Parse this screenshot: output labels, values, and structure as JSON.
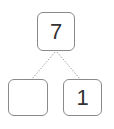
{
  "number_bond": {
    "whole": "7",
    "parts": [
      "",
      "1"
    ]
  },
  "colors": {
    "border": "#8a8a8a",
    "text": "#333333",
    "connector": "#a0a0a0"
  }
}
